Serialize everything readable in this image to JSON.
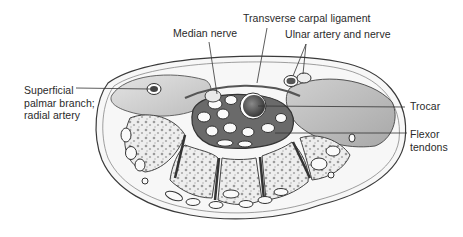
{
  "figure": {
    "labels": {
      "median_nerve": "Median nerve",
      "transverse_carpal_ligament": "Transverse carpal ligament",
      "ulnar_artery_and_nerve": "Ulnar artery and nerve",
      "superficial_palmar_branch": "Superficial\npalmar branch;\nradial artery",
      "trocar": "Trocar",
      "flexor_tendons": "Flexor\ntendons"
    },
    "colors": {
      "ink": "#2a2a2a",
      "outline": "#3a3a3a",
      "tissue_light": "#f2f2f2",
      "tissue_mid": "#d9d9d9",
      "tissue_dark": "#8a8a8a",
      "trocar": "#555555",
      "background": "#ffffff"
    }
  }
}
